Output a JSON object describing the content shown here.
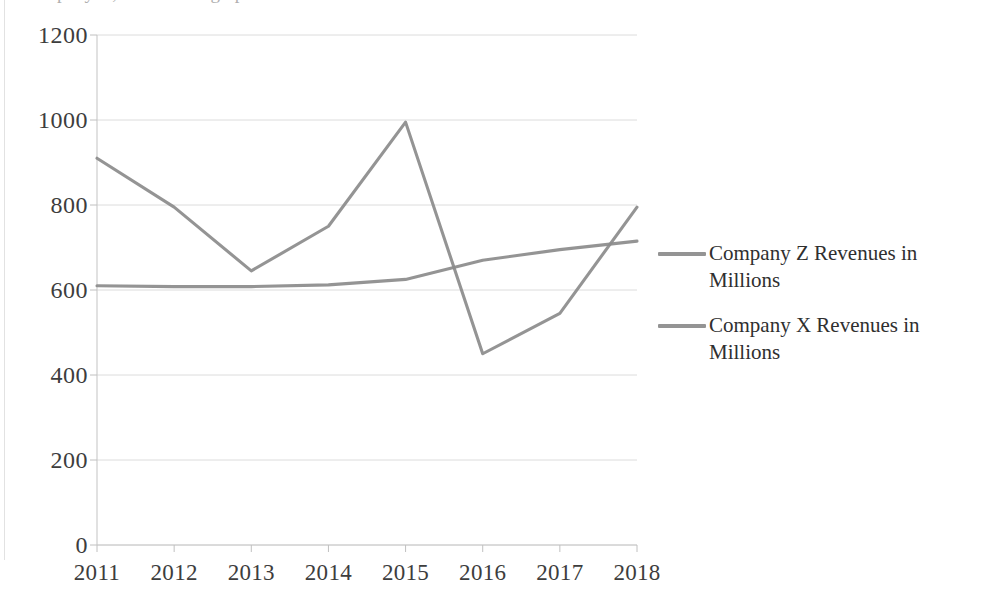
{
  "figure": {
    "title_clipped": "Company X, Z revenues graph",
    "background_color": "#ffffff",
    "line_color": "#8c8c8c",
    "grid_color": "#dcdcdc",
    "text_color": "#3d3d3d"
  },
  "legend": {
    "position": "right",
    "items": [
      {
        "label": "Company Z Revenues in Millions",
        "color": "#949494"
      },
      {
        "label": "Company X Revenues in Millions",
        "color": "#949494"
      }
    ]
  },
  "axis": {
    "y_ticks": [
      "1200",
      "1000",
      "800",
      "600",
      "400",
      "200",
      "0"
    ],
    "x_ticks": [
      "2011",
      "2012",
      "2013",
      "2014",
      "2015",
      "2016",
      "2017",
      "2018"
    ]
  },
  "chart_data": {
    "type": "line",
    "title": "Company X, Z revenues graph",
    "xlabel": "",
    "ylabel": "",
    "categories": [
      "2011",
      "2012",
      "2013",
      "2014",
      "2015",
      "2016",
      "2017",
      "2018"
    ],
    "x": [
      2011,
      2012,
      2013,
      2014,
      2015,
      2016,
      2017,
      2018
    ],
    "series": [
      {
        "name": "Company Z Revenues in Millions",
        "color": "#8c8c8c",
        "values": [
          910,
          795,
          645,
          750,
          995,
          450,
          545,
          795
        ]
      },
      {
        "name": "Company X Revenues in Millions",
        "color": "#8c8c8c",
        "values": [
          610,
          608,
          608,
          612,
          625,
          670,
          695,
          715
        ]
      }
    ],
    "ylim": [
      0,
      1200
    ],
    "ytick_step": 200,
    "grid": true,
    "grid_axis": "y",
    "legend_position": "right",
    "units": "Millions"
  }
}
